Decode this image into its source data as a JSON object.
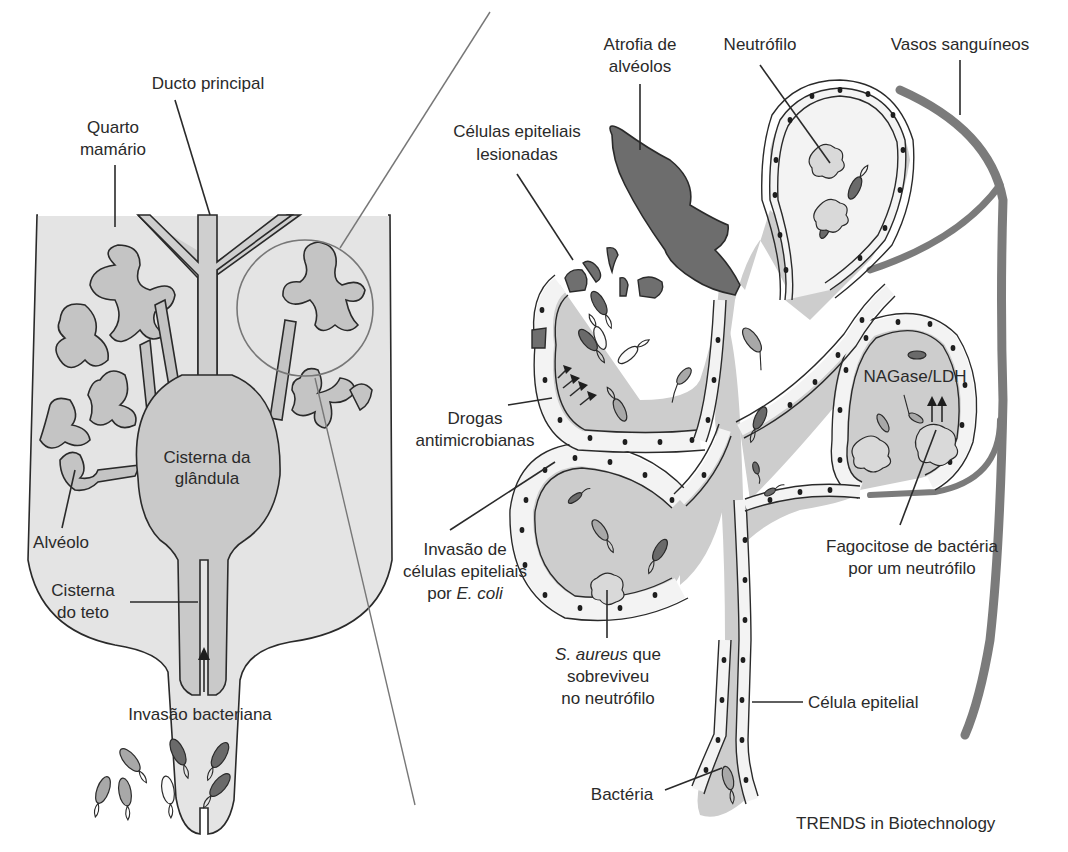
{
  "figure": {
    "credit": "TRENDS in Biotechnology"
  },
  "left_panel": {
    "labels": {
      "ducto_principal": "Ducto principal",
      "quarto_line1": "Quarto",
      "quarto_line2": "mamário",
      "cisterna_glandula_line1": "Cisterna da",
      "cisterna_glandula_line2": "glândula",
      "alveolo": "Alvéolo",
      "cisterna_teto_line1": "Cisterna",
      "cisterna_teto_line2": "do teto",
      "invasao_bacteriana": "Invasão bacteriana"
    }
  },
  "right_panel": {
    "labels": {
      "atrofia_line1": "Atrofia de",
      "atrofia_line2": "alvéolos",
      "neutrofilo": "Neutrófilo",
      "vasos": "Vasos sanguíneos",
      "celulas_lesionadas_line1": "Células epiteliais",
      "celulas_lesionadas_line2": "lesionadas",
      "drogas_line1": "Drogas",
      "drogas_line2": "antimicrobianas",
      "invasao_ecoli_line1": "Invasão de",
      "invasao_ecoli_line2": "células epiteliais",
      "invasao_ecoli_line3_prefix": "por ",
      "invasao_ecoli_line3_italic": "E. coli",
      "nagase": "NAGase/LDH",
      "fagocitose_line1": "Fagocitose de bactéria",
      "fagocitose_line2": "por um neutrófilo",
      "saureus_line1_italic": "S. aureus",
      "saureus_line1_suffix": " que",
      "saureus_line2": "sobreviveu",
      "saureus_line3": "no neutrófilo",
      "celula_epitelial": "Célula epitelial",
      "bacteria": "Bactéria"
    }
  },
  "colors": {
    "tissue_fill": "#cdcdcd",
    "dark_tissue": "#6d6d6d",
    "vessel": "#7b7b7b",
    "outline": "#2a2a2a"
  }
}
